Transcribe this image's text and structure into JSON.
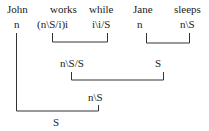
{
  "words": [
    {
      "text": "John",
      "x": 7,
      "y": 3
    },
    {
      "text": "works",
      "x": 50,
      "y": 3
    },
    {
      "text": "while",
      "x": 89,
      "y": 3
    },
    {
      "text": "Jane",
      "x": 133,
      "y": 3
    },
    {
      "text": "sleeps",
      "x": 174,
      "y": 3
    }
  ],
  "categories": [
    {
      "text": "n",
      "x": 14,
      "y": 18
    },
    {
      "text": "(n\\S/i)i",
      "x": 37,
      "y": 18
    },
    {
      "text": "i\\i/S",
      "x": 92,
      "y": 18
    },
    {
      "text": "n",
      "x": 137,
      "y": 18
    },
    {
      "text": "n\\S",
      "x": 180,
      "y": 18
    }
  ],
  "derived": [
    {
      "text": "n\\S/S",
      "x": 60,
      "y": 57
    },
    {
      "text": "S",
      "x": 155,
      "y": 57
    },
    {
      "text": "n\\S",
      "x": 88,
      "y": 91
    },
    {
      "text": "S",
      "x": 53,
      "y": 116
    }
  ],
  "line_color": "#333333"
}
